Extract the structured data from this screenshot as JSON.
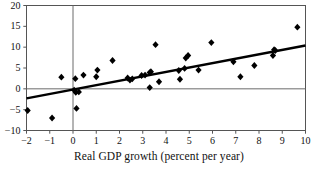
{
  "chart_data": {
    "type": "scatter",
    "title": "",
    "subtitle": "",
    "xlabel": "Real GDP growth (percent per year)",
    "ylabel": "",
    "xlim": [
      -2,
      10
    ],
    "ylim": [
      -10,
      20
    ],
    "xticks": [
      -2,
      -1,
      0,
      1,
      2,
      3,
      4,
      5,
      6,
      7,
      8,
      9,
      10
    ],
    "xtick_labels": [
      "−2",
      "−1",
      "0",
      "1",
      "2",
      "3",
      "4",
      "5",
      "6",
      "7",
      "8",
      "9",
      "10"
    ],
    "yticks": [
      -10,
      -5,
      0,
      5,
      10,
      15,
      20
    ],
    "ytick_labels": [
      "−10",
      "−5",
      "0",
      "5",
      "10",
      "15",
      "20"
    ],
    "grid": false,
    "legend": "none",
    "marker": "diamond",
    "marker_color": "#000000",
    "axis_color": "#555555",
    "zero_line_y": 0,
    "zero_line_x": 0,
    "points": [
      {
        "x": -1.95,
        "y": -5.2
      },
      {
        "x": -0.9,
        "y": -7.0
      },
      {
        "x": -0.5,
        "y": 2.8
      },
      {
        "x": 0.1,
        "y": 2.45
      },
      {
        "x": 0.15,
        "y": -4.7
      },
      {
        "x": 0.05,
        "y": -0.3
      },
      {
        "x": 0.12,
        "y": -0.85
      },
      {
        "x": 0.25,
        "y": -0.75
      },
      {
        "x": 0.45,
        "y": 3.3
      },
      {
        "x": 1.0,
        "y": 2.9
      },
      {
        "x": 1.05,
        "y": 4.5
      },
      {
        "x": 1.7,
        "y": 6.8
      },
      {
        "x": 2.35,
        "y": 2.6
      },
      {
        "x": 2.45,
        "y": 2.1
      },
      {
        "x": 2.55,
        "y": 2.4
      },
      {
        "x": 2.95,
        "y": 3.2
      },
      {
        "x": 3.1,
        "y": 3.3
      },
      {
        "x": 3.3,
        "y": 3.9
      },
      {
        "x": 3.3,
        "y": 0.3
      },
      {
        "x": 3.35,
        "y": 4.1
      },
      {
        "x": 3.55,
        "y": 10.6
      },
      {
        "x": 3.7,
        "y": 1.7
      },
      {
        "x": 4.55,
        "y": 4.4
      },
      {
        "x": 4.6,
        "y": 2.3
      },
      {
        "x": 4.8,
        "y": 4.9
      },
      {
        "x": 4.85,
        "y": 7.4
      },
      {
        "x": 4.95,
        "y": 8.0
      },
      {
        "x": 5.4,
        "y": 4.5
      },
      {
        "x": 5.95,
        "y": 11.1
      },
      {
        "x": 6.9,
        "y": 6.5
      },
      {
        "x": 7.2,
        "y": 2.9
      },
      {
        "x": 7.8,
        "y": 5.6
      },
      {
        "x": 8.6,
        "y": 8.0
      },
      {
        "x": 8.65,
        "y": 9.4
      },
      {
        "x": 8.7,
        "y": 9.2
      },
      {
        "x": 9.65,
        "y": 14.8
      }
    ],
    "trendline": {
      "label": "fitted regression line",
      "x_start": -2,
      "y_start": -2.3,
      "x_end": 10,
      "y_end": 10.4
    }
  }
}
